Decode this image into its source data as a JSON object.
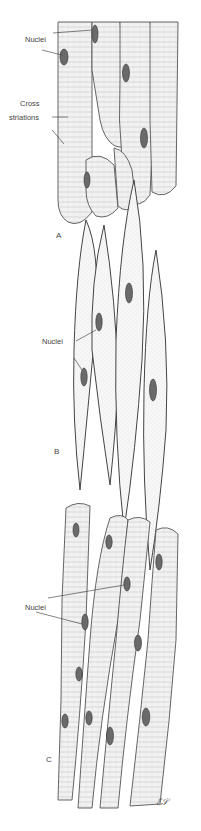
{
  "figure": {
    "panels": [
      {
        "id": "A",
        "label": "A",
        "labels": [
          "Nuclei",
          "Cross striations"
        ],
        "label_lines": [
          "Nuclei",
          "Cross",
          "striations"
        ]
      },
      {
        "id": "B",
        "label": "B",
        "labels": [
          "Nuclei"
        ]
      },
      {
        "id": "C",
        "label": "C",
        "labels": [
          "Nuclei"
        ]
      }
    ],
    "signature": "ℰ𝒮"
  },
  "colors": {
    "background": "#ffffff",
    "nucleus": "#6a6a6a",
    "outline": "#444444"
  }
}
